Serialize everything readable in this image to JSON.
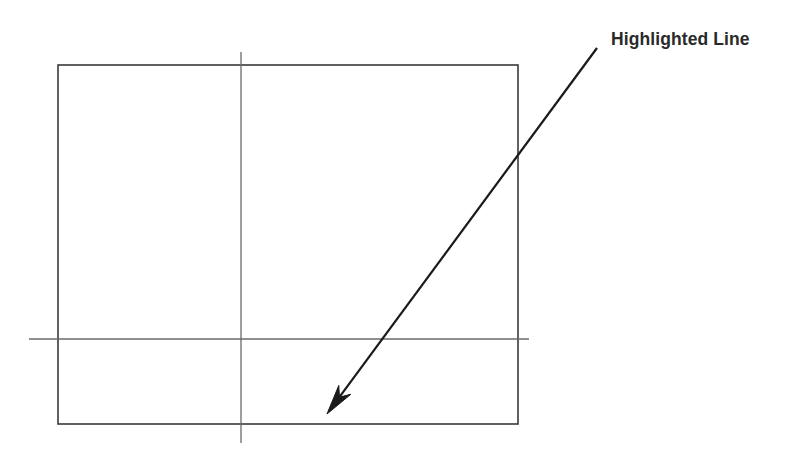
{
  "figure": {
    "background_color": "#ffffff",
    "width": 793,
    "height": 458,
    "annotation": {
      "label": "Highlighted Line",
      "label_color": "#2a2a2a",
      "arrow_color": "#1a1a1a",
      "arrow_start_x": 597,
      "arrow_start_y": 48,
      "arrow_tip_x": 327,
      "arrow_tip_y": 414,
      "arrow_width": 2.2
    },
    "rectangle": {
      "name": "outline-rectangle",
      "x": 58,
      "y": 65,
      "width": 460,
      "height": 359,
      "stroke_color": "#3a3a3a",
      "stroke_width": 1.6,
      "fill": "none"
    },
    "crosshair": {
      "vertical_line": {
        "name": "vertical-axis-line",
        "x": 241,
        "y_start": 52,
        "y_end": 443,
        "stroke_color": "#6a6a6a",
        "stroke_width": 1.3
      },
      "horizontal_line": {
        "name": "horizontal-axis-line",
        "y": 339,
        "x_start": 29,
        "x_end": 529,
        "stroke_color": "#6a6a6a",
        "stroke_width": 1.3
      }
    }
  }
}
